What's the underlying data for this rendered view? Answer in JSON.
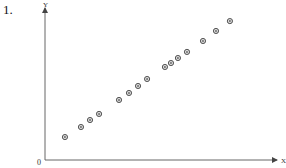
{
  "problem_number": "1.",
  "chart_data": {
    "type": "scatter",
    "title": "",
    "xlabel": "X",
    "ylabel": "Y",
    "origin_label": "0",
    "xlim": [
      0,
      100
    ],
    "ylim": [
      0,
      100
    ],
    "grid": false,
    "legend": null,
    "marker": "circled-dot",
    "marker_color": "#444444",
    "axis_color": "#666666",
    "x": [
      8.6,
      15.5,
      19.4,
      23.3,
      31.9,
      36.2,
      40.1,
      44.0,
      51.7,
      54.3,
      57.3,
      61.2,
      68.1,
      73.7,
      79.7
    ],
    "y": [
      15.1,
      21.7,
      26.3,
      30.3,
      39.5,
      44.1,
      48.7,
      53.3,
      61.2,
      63.8,
      67.1,
      71.1,
      78.3,
      84.9,
      91.4
    ]
  },
  "layout": {
    "origin_px": [
      45,
      160
    ],
    "x_end_px": 277,
    "y_end_px": 8
  }
}
